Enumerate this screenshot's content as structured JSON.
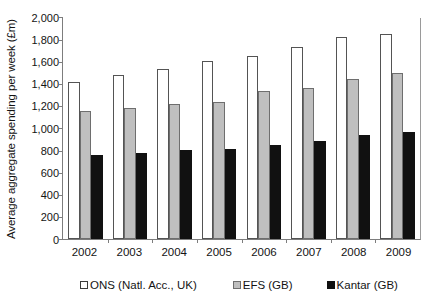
{
  "chart_data": {
    "type": "bar",
    "title": "",
    "xlabel": "",
    "ylabel": "Average aggregate spending per week (£m)",
    "categories": [
      "2002",
      "2003",
      "2004",
      "2005",
      "2006",
      "2007",
      "2008",
      "2009"
    ],
    "series": [
      {
        "name": "ONS (Natl. Acc., UK)",
        "color": "#ffffff",
        "values": [
          1415,
          1475,
          1535,
          1600,
          1650,
          1730,
          1820,
          1850
        ]
      },
      {
        "name": "EFS (GB)",
        "color": "#bfbfbf",
        "values": [
          1150,
          1180,
          1220,
          1230,
          1330,
          1360,
          1440,
          1495
        ]
      },
      {
        "name": "Kantar (GB)",
        "color": "#111111",
        "values": [
          755,
          778,
          800,
          812,
          845,
          885,
          940,
          968
        ]
      }
    ],
    "ylim": [
      0,
      2000
    ],
    "yticks": [
      0,
      200,
      400,
      600,
      800,
      1000,
      1200,
      1400,
      1600,
      1800,
      2000
    ],
    "ytick_labels": [
      "0",
      "200",
      "400",
      "600",
      "800",
      "1,000",
      "1,200",
      "1,400",
      "1,600",
      "1,800",
      "2,000"
    ],
    "grid": false,
    "legend_position": "bottom"
  },
  "legend": {
    "items": [
      {
        "label": "ONS (Natl. Acc., UK)",
        "swatch": "sw-ons"
      },
      {
        "label": "EFS (GB)",
        "swatch": "sw-efs"
      },
      {
        "label": "Kantar (GB)",
        "swatch": "sw-kantar"
      }
    ]
  }
}
